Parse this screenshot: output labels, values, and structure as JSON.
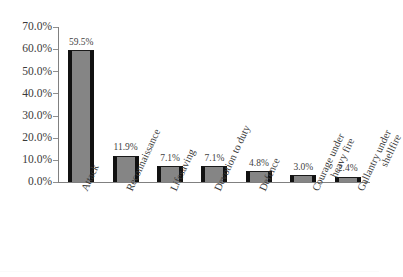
{
  "chart_data": {
    "type": "bar",
    "title": "",
    "subtitle": "",
    "xlabel": "",
    "ylabel": "",
    "ylim": [
      0,
      70
    ],
    "grid": false,
    "legend": "none",
    "categories": [
      "Attack",
      "Reconnaissance",
      "Lifesaving",
      "Devotion to duty",
      "Defence",
      "Courage under heavy fire",
      "Gallantry under shellfire"
    ],
    "category_lines": [
      [
        "Attack"
      ],
      [
        "Reconnaissance"
      ],
      [
        "Lifesaving"
      ],
      [
        "Devotion to duty"
      ],
      [
        "Defence"
      ],
      [
        "Courage under",
        "heavy fire"
      ],
      [
        "Gallantry under",
        "shellfire"
      ]
    ],
    "values": [
      59.5,
      11.9,
      7.1,
      7.1,
      4.8,
      3.0,
      2.4
    ],
    "data_labels": [
      "59.5%",
      "11.9%",
      "7.1%",
      "7.1%",
      "4.8%",
      "3.0%",
      "2.4%"
    ],
    "y_ticks": [
      70,
      60,
      50,
      40,
      30,
      20,
      10,
      0
    ],
    "y_tick_labels": [
      "70.0%",
      "60.0%",
      "50.0%",
      "40.0%",
      "30.0%",
      "20.0%",
      "10.0%",
      "0.0%"
    ],
    "colors": {
      "bar_fill": "#858585",
      "bar_edge": "#111111",
      "axis": "#808080",
      "text": "#3a3a3a",
      "background": "#ffffff"
    }
  }
}
